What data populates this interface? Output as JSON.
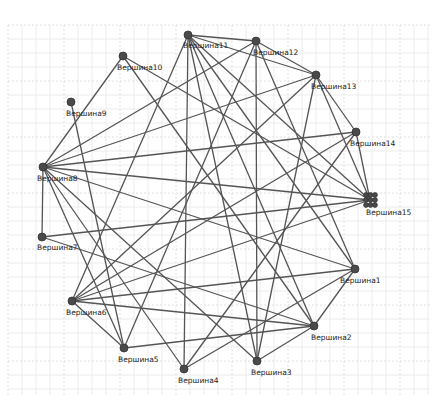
{
  "graph": {
    "background": "#ffffff",
    "grid": {
      "x0": 8,
      "y0": 25,
      "x1": 430,
      "y1": 395,
      "step": 14,
      "color": "#ececec"
    },
    "edge_color": "#555555",
    "node_color": "#4a4a4a",
    "nodes": [
      {
        "id": "v1",
        "label": "Вершина1",
        "x": 355,
        "y": 269,
        "lx": 340,
        "ly": 283
      },
      {
        "id": "v2",
        "label": "Вершина2",
        "x": 314,
        "y": 326,
        "lx": 311,
        "ly": 340
      },
      {
        "id": "v3",
        "label": "Вершина3",
        "x": 257,
        "y": 361,
        "lx": 251,
        "ly": 375
      },
      {
        "id": "v4",
        "label": "Вершина4",
        "x": 184,
        "y": 369,
        "lx": 178,
        "ly": 383
      },
      {
        "id": "v5",
        "label": "Вершина5",
        "x": 124,
        "y": 348,
        "lx": 118,
        "ly": 362
      },
      {
        "id": "v6",
        "label": "Вершина6",
        "x": 72,
        "y": 301,
        "lx": 66,
        "ly": 315
      },
      {
        "id": "v7",
        "label": "Вершина7",
        "x": 42,
        "y": 237,
        "lx": 37,
        "ly": 250
      },
      {
        "id": "v8",
        "label": "Вершина8",
        "x": 43,
        "y": 167,
        "lx": 37,
        "ly": 181
      },
      {
        "id": "v9",
        "label": "Вершина9",
        "x": 71,
        "y": 102,
        "lx": 66,
        "ly": 116
      },
      {
        "id": "v10",
        "label": "Вершина10",
        "x": 123,
        "y": 56,
        "lx": 117,
        "ly": 70
      },
      {
        "id": "v11",
        "label": "Вершина11",
        "x": 188,
        "y": 35,
        "lx": 183,
        "ly": 48
      },
      {
        "id": "v12",
        "label": "Вершина12",
        "x": 256,
        "y": 41,
        "lx": 253,
        "ly": 55
      },
      {
        "id": "v13",
        "label": "Вершина13",
        "x": 316,
        "y": 75,
        "lx": 311,
        "ly": 89
      },
      {
        "id": "v14",
        "label": "Вершина14",
        "x": 356,
        "y": 132,
        "lx": 350,
        "ly": 146
      },
      {
        "id": "v15",
        "label": "Вершина15",
        "x": 370,
        "y": 200,
        "lx": 366,
        "ly": 215,
        "cluster": true
      }
    ],
    "edges": [
      [
        "v10",
        "v8"
      ],
      [
        "v10",
        "v2"
      ],
      [
        "v10",
        "v15"
      ],
      [
        "v9",
        "v5"
      ],
      [
        "v11",
        "v12"
      ],
      [
        "v11",
        "v6"
      ],
      [
        "v11",
        "v4"
      ],
      [
        "v11",
        "v3"
      ],
      [
        "v11",
        "v2"
      ],
      [
        "v11",
        "v1"
      ],
      [
        "v11",
        "v15"
      ],
      [
        "v11",
        "v13"
      ],
      [
        "v12",
        "v8"
      ],
      [
        "v12",
        "v3"
      ],
      [
        "v12",
        "v1"
      ],
      [
        "v12",
        "v13"
      ],
      [
        "v12",
        "v5"
      ],
      [
        "v13",
        "v14"
      ],
      [
        "v13",
        "v6"
      ],
      [
        "v13",
        "v3"
      ],
      [
        "v13",
        "v15"
      ],
      [
        "v13",
        "v8"
      ],
      [
        "v14",
        "v8"
      ],
      [
        "v14",
        "v4"
      ],
      [
        "v14",
        "v15"
      ],
      [
        "v14",
        "v6"
      ],
      [
        "v15",
        "v8"
      ],
      [
        "v15",
        "v6"
      ],
      [
        "v15",
        "v7"
      ],
      [
        "v1",
        "v8"
      ],
      [
        "v1",
        "v6"
      ],
      [
        "v1",
        "v4"
      ],
      [
        "v1",
        "v2"
      ],
      [
        "v2",
        "v7"
      ],
      [
        "v2",
        "v5"
      ],
      [
        "v2",
        "v6"
      ],
      [
        "v2",
        "v3"
      ],
      [
        "v3",
        "v8"
      ],
      [
        "v4",
        "v8"
      ],
      [
        "v5",
        "v8"
      ],
      [
        "v5",
        "v6"
      ],
      [
        "v7",
        "v8"
      ]
    ]
  }
}
